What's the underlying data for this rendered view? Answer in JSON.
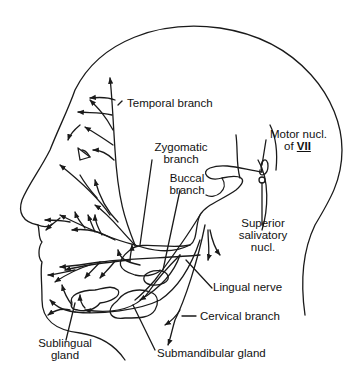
{
  "diagram": {
    "colors": {
      "line": "#1a1a1a",
      "text": "#111111",
      "background": "#ffffff"
    },
    "labels": {
      "temporal_branch": "Temporal branch",
      "zygomatic_branch_1": "Zygomatic",
      "zygomatic_branch_2": "branch",
      "buccal_branch_1": "Buccal",
      "buccal_branch_2": "branch",
      "motor_nucl_1": "Motor nucl.",
      "motor_nucl_2_prefix": "of ",
      "motor_nucl_2_numeral": "VII",
      "superior_salivatory_1": "Superior",
      "superior_salivatory_2": "salivatory",
      "superior_salivatory_3": "nucl.",
      "lingual_nerve": "Lingual nerve",
      "cervical_branch": "Cervical branch",
      "sublingual_gland_1": "Sublingual",
      "sublingual_gland_2": "gland",
      "submandibular_gland": "Submandibular gland"
    }
  }
}
